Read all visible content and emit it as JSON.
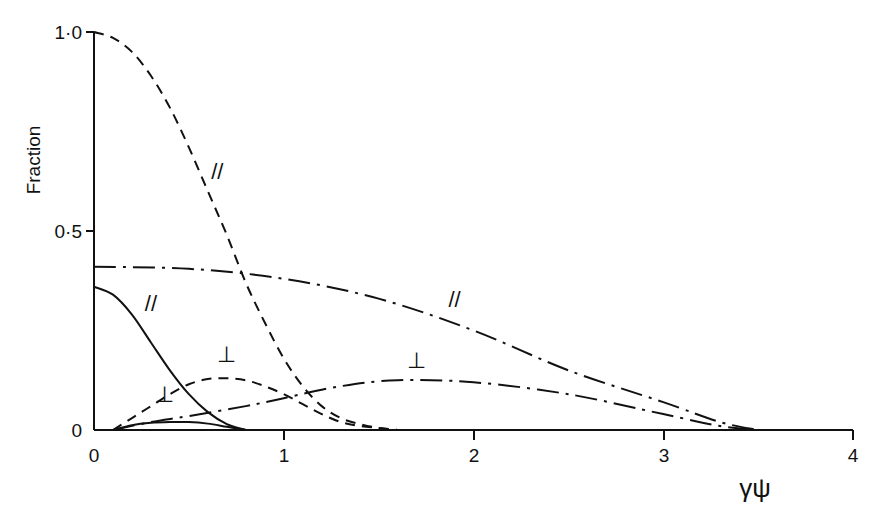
{
  "chart_data": {
    "type": "line",
    "title": "",
    "xlabel": "γψ",
    "ylabel": "Fraction",
    "xlim": [
      0,
      4
    ],
    "ylim": [
      0,
      1.0
    ],
    "x_ticks": [
      "0",
      "1",
      "2",
      "3",
      "4"
    ],
    "y_ticks": [
      "0",
      "0·5",
      "1·0"
    ],
    "grid": false,
    "legend": "none (inline curve labels)",
    "series": [
      {
        "name": "dashed //",
        "style": "dashed",
        "label": "//",
        "x": [
          0,
          0.1,
          0.2,
          0.3,
          0.4,
          0.5,
          0.6,
          0.7,
          0.8,
          0.9,
          1.0,
          1.1,
          1.2,
          1.3,
          1.4,
          1.5,
          1.6
        ],
        "y": [
          1.0,
          0.985,
          0.95,
          0.89,
          0.81,
          0.71,
          0.6,
          0.49,
          0.37,
          0.27,
          0.18,
          0.11,
          0.06,
          0.03,
          0.015,
          0.005,
          0.0
        ]
      },
      {
        "name": "dashed ⊥",
        "style": "dashed",
        "label": "⊥",
        "x": [
          0.1,
          0.2,
          0.3,
          0.4,
          0.5,
          0.6,
          0.7,
          0.8,
          0.9,
          1.0,
          1.1,
          1.2,
          1.3,
          1.4,
          1.5,
          1.6
        ],
        "y": [
          0.0,
          0.03,
          0.06,
          0.09,
          0.115,
          0.128,
          0.13,
          0.125,
          0.11,
          0.09,
          0.065,
          0.04,
          0.02,
          0.01,
          0.005,
          0.0
        ]
      },
      {
        "name": "solid //",
        "style": "solid",
        "label": "//",
        "x": [
          0,
          0.1,
          0.2,
          0.3,
          0.4,
          0.5,
          0.6,
          0.7,
          0.8
        ],
        "y": [
          0.36,
          0.34,
          0.29,
          0.22,
          0.15,
          0.09,
          0.045,
          0.015,
          0.0
        ]
      },
      {
        "name": "solid ⊥",
        "style": "solid",
        "label": "⊥",
        "x": [
          0.1,
          0.2,
          0.3,
          0.4,
          0.5,
          0.6,
          0.7,
          0.8
        ],
        "y": [
          0.0,
          0.012,
          0.018,
          0.02,
          0.02,
          0.016,
          0.008,
          0.0
        ]
      },
      {
        "name": "dash-dot //",
        "style": "dashdot",
        "label": "//",
        "x": [
          0,
          0.5,
          1.0,
          1.5,
          2.0,
          2.5,
          3.0,
          3.3,
          3.5
        ],
        "y": [
          0.41,
          0.405,
          0.38,
          0.33,
          0.25,
          0.15,
          0.07,
          0.02,
          0.0
        ]
      },
      {
        "name": "dash-dot ⊥",
        "style": "dashdot",
        "label": "⊥",
        "x": [
          0.1,
          0.3,
          0.5,
          0.8,
          1.0,
          1.3,
          1.6,
          2.0,
          2.5,
          3.0,
          3.3,
          3.5
        ],
        "y": [
          0.0,
          0.02,
          0.035,
          0.06,
          0.08,
          0.11,
          0.125,
          0.12,
          0.09,
          0.04,
          0.01,
          0.0
        ]
      }
    ],
    "annotations": [
      {
        "text": "//",
        "x": 0.65,
        "y": 0.63,
        "refers_to": "dashed //"
      },
      {
        "text": "//",
        "x": 0.3,
        "y": 0.3,
        "refers_to": "solid //"
      },
      {
        "text": "//",
        "x": 1.9,
        "y": 0.31,
        "refers_to": "dash-dot //"
      },
      {
        "text": "⊥",
        "x": 0.7,
        "y": 0.17,
        "refers_to": "dashed ⊥"
      },
      {
        "text": "⊥",
        "x": 0.37,
        "y": 0.07,
        "refers_to": "solid ⊥"
      },
      {
        "text": "⊥",
        "x": 1.7,
        "y": 0.155,
        "refers_to": "dash-dot ⊥"
      }
    ]
  },
  "labels": {
    "ylabel": "Fraction",
    "xlabel": "γψ",
    "y_tick_0": "0",
    "y_tick_05": "0·5",
    "y_tick_1": "1·0",
    "x_tick_0": "0",
    "x_tick_1": "1",
    "x_tick_2": "2",
    "x_tick_3": "3",
    "x_tick_4": "4"
  }
}
